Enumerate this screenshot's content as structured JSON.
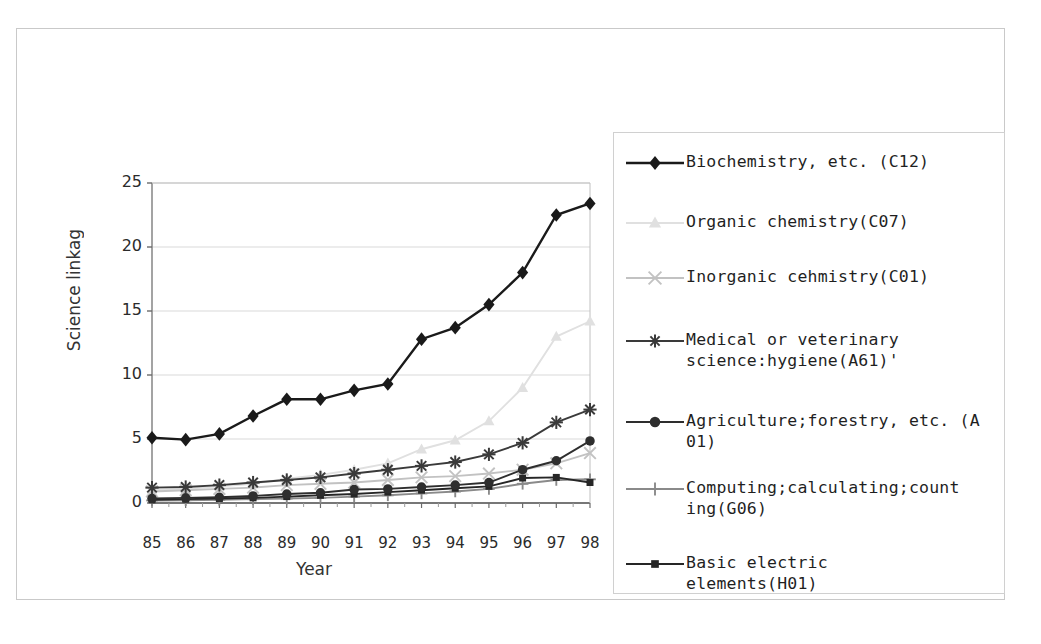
{
  "chart_data": {
    "type": "line",
    "title": "",
    "xlabel": "Year",
    "ylabel": "Science linkage",
    "ylabel_display": "Science linkag",
    "categories": [
      "85",
      "86",
      "87",
      "88",
      "89",
      "90",
      "91",
      "92",
      "93",
      "94",
      "95",
      "96",
      "97",
      "98"
    ],
    "x": [
      85,
      86,
      87,
      88,
      89,
      90,
      91,
      92,
      93,
      94,
      95,
      96,
      97,
      98
    ],
    "ylim": [
      0,
      25
    ],
    "yticks": [
      0,
      5,
      10,
      15,
      20,
      25
    ],
    "xlim": [
      85,
      98
    ],
    "grid": "horizontal",
    "legend_position": "right",
    "series": [
      {
        "name": "Biochemistry, etc. (C12)",
        "label_lines": [
          "Biochemistry, etc. (C12)"
        ],
        "marker": "diamond",
        "color": "#1a1a1a",
        "values": [
          5.1,
          4.95,
          5.4,
          6.8,
          8.1,
          8.1,
          8.8,
          9.3,
          12.8,
          13.7,
          15.5,
          18.0,
          22.5,
          23.4
        ]
      },
      {
        "name": "Organic chemistry(C07)",
        "label_lines": [
          "Organic chemistry(C07)"
        ],
        "marker": "triangle",
        "color": "#e0e0e0",
        "values": [
          1.0,
          1.1,
          1.3,
          1.5,
          1.9,
          2.2,
          2.6,
          3.1,
          4.2,
          4.9,
          6.4,
          9.0,
          13.0,
          14.2
        ]
      },
      {
        "name": "Inorganic cehmistry(C01)",
        "label_lines": [
          "Inorganic cehmistry(C01)"
        ],
        "marker": "x",
        "color": "#c2c2c2",
        "values": [
          0.9,
          1.0,
          1.1,
          1.2,
          1.4,
          1.5,
          1.6,
          1.8,
          2.0,
          2.1,
          2.3,
          2.6,
          3.1,
          3.9
        ]
      },
      {
        "name": "Medical or veterinary science:hygiene(A61)'",
        "label_lines": [
          "Medical or veterinary",
          "science:hygiene(A61)'"
        ],
        "marker": "asterisk",
        "color": "#3a3a3a",
        "values": [
          1.2,
          1.25,
          1.4,
          1.6,
          1.8,
          2.0,
          2.3,
          2.6,
          2.9,
          3.2,
          3.8,
          4.7,
          6.3,
          7.3
        ]
      },
      {
        "name": "Agriculture;forestry, etc. (A01)",
        "label_lines": [
          "Agriculture;forestry, etc. (A",
          "01)"
        ],
        "marker": "circle",
        "color": "#2e2e2e",
        "values": [
          0.35,
          0.4,
          0.45,
          0.55,
          0.7,
          0.8,
          1.05,
          1.1,
          1.25,
          1.4,
          1.6,
          2.6,
          3.3,
          4.85
        ]
      },
      {
        "name": "Computing;calculating;counting(G06)",
        "label_lines": [
          "Computing;calculating;count",
          "ing(G06)"
        ],
        "marker": "plus",
        "color": "#8a8a8a",
        "values": [
          0.2,
          0.22,
          0.25,
          0.3,
          0.35,
          0.4,
          0.5,
          0.6,
          0.75,
          0.9,
          1.1,
          1.5,
          1.8,
          1.85
        ]
      },
      {
        "name": "Basic electric elements(H01)",
        "label_lines": [
          "Basic electric",
          "elements(H01)"
        ],
        "marker": "square",
        "color": "#262626",
        "values": [
          0.25,
          0.3,
          0.35,
          0.4,
          0.5,
          0.6,
          0.7,
          0.85,
          1.0,
          1.15,
          1.3,
          1.95,
          2.0,
          1.6
        ]
      }
    ]
  },
  "artifact": {
    "top_text": ""
  }
}
